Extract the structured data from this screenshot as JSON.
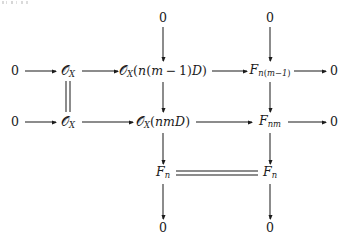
{
  "diagram": {
    "kind": "commutative-diagram",
    "columns": [
      {
        "id": "c1",
        "x": 15
      },
      {
        "id": "c2",
        "x": 68
      },
      {
        "id": "c3",
        "x": 163
      },
      {
        "id": "c4",
        "x": 270
      },
      {
        "id": "c5",
        "x": 334
      }
    ],
    "rows": [
      {
        "id": "r0",
        "y": 18
      },
      {
        "id": "r1",
        "y": 71
      },
      {
        "id": "r2",
        "y": 122
      },
      {
        "id": "r3",
        "y": 173
      },
      {
        "id": "r4",
        "y": 228
      }
    ],
    "nodes": {
      "top_zero_col3": "0",
      "top_zero_col4": "0",
      "row1_left_zero": "0",
      "row1_structure_sheaf": {
        "base": "O",
        "sub": "X"
      },
      "row1_twist": {
        "base": "O",
        "sub": "X",
        "arg": "(n(m − 1)D)"
      },
      "row1_quotient": {
        "base": "F",
        "sub": "n(m−1)"
      },
      "row1_right_zero": "0",
      "row2_left_zero": "0",
      "row2_structure_sheaf": {
        "base": "O",
        "sub": "X"
      },
      "row2_twist": {
        "base": "O",
        "sub": "X",
        "arg": "(nmD)"
      },
      "row2_quotient": {
        "base": "F",
        "sub": "nm"
      },
      "row2_right_zero": "0",
      "row3_left_sheaf": {
        "base": "F",
        "sub": "n"
      },
      "row3_right_sheaf": {
        "base": "F",
        "sub": "n"
      },
      "bottom_zero_col3": "0",
      "bottom_zero_col4": "0"
    },
    "arrows": {
      "horizontal": [
        {
          "name": "row1-zero-to-ox",
          "row": "r1",
          "from": "c1",
          "to": "c2"
        },
        {
          "name": "row1-ox-to-twist",
          "row": "r1",
          "from": "c2",
          "to": "c3"
        },
        {
          "name": "row1-twist-to-quotient",
          "row": "r1",
          "from": "c3",
          "to": "c4"
        },
        {
          "name": "row1-quotient-to-zero",
          "row": "r1",
          "from": "c4",
          "to": "c5"
        },
        {
          "name": "row2-zero-to-ox",
          "row": "r2",
          "from": "c1",
          "to": "c2"
        },
        {
          "name": "row2-ox-to-twist",
          "row": "r2",
          "from": "c2",
          "to": "c3"
        },
        {
          "name": "row2-twist-to-quotient",
          "row": "r2",
          "from": "c3",
          "to": "c4"
        },
        {
          "name": "row2-quotient-to-zero",
          "row": "r2",
          "from": "c4",
          "to": "c5"
        }
      ],
      "vertical": [
        {
          "name": "col3-topzero-to-row1",
          "col": "c3",
          "from": "r0",
          "to": "r1"
        },
        {
          "name": "col4-topzero-to-row1",
          "col": "c4",
          "from": "r0",
          "to": "r1"
        },
        {
          "name": "col3-row1-to-row2",
          "col": "c3",
          "from": "r1",
          "to": "r2"
        },
        {
          "name": "col4-row1-to-row2",
          "col": "c4",
          "from": "r1",
          "to": "r2"
        },
        {
          "name": "col3-row2-to-row3",
          "col": "c3",
          "from": "r2",
          "to": "r3"
        },
        {
          "name": "col4-row2-to-row3",
          "col": "c4",
          "from": "r2",
          "to": "r3"
        },
        {
          "name": "col3-row3-to-bottomzero",
          "col": "c3",
          "from": "r3",
          "to": "r4"
        },
        {
          "name": "col4-row3-to-bottomzero",
          "col": "c4",
          "from": "r3",
          "to": "r4"
        }
      ],
      "equalities": [
        {
          "name": "col2-vertical-equality",
          "orientation": "vertical",
          "col": "c2",
          "from": "r1",
          "to": "r2"
        },
        {
          "name": "row3-horizontal-equality",
          "orientation": "horizontal",
          "row": "r3",
          "from": "c3",
          "to": "c4"
        }
      ]
    },
    "style": {
      "ink": "#1b1b1b",
      "background": "#ffffff"
    }
  }
}
